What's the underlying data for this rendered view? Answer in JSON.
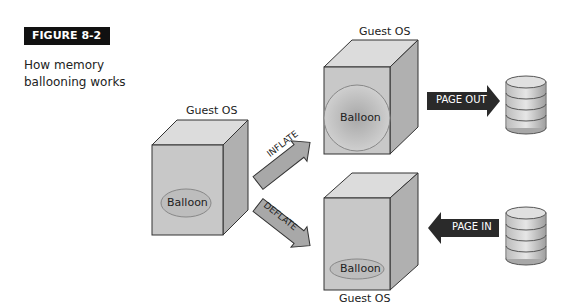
{
  "figure": {
    "tag": "FIGURE 8-2",
    "caption_line1": "How memory",
    "caption_line2": "ballooning works"
  },
  "vms": {
    "left": {
      "label": "Guest OS",
      "balloon": "Balloon"
    },
    "top_right": {
      "label": "Guest OS",
      "balloon": "Balloon"
    },
    "bottom_right": {
      "label": "Guest OS",
      "balloon": "Balloon"
    }
  },
  "arrows": {
    "inflate": "INFLATE",
    "deflate": "DEFLATE",
    "page_out": "PAGE OUT",
    "page_in": "PAGE IN"
  },
  "colors": {
    "box_front": "#c8c8c8",
    "box_top": "#dcdcdc",
    "box_side": "#b0b0b0",
    "arrow_gray": "#a8a8a8",
    "arrow_dark": "#2a2a2a",
    "balloon_fill": "#bdbdbd"
  }
}
